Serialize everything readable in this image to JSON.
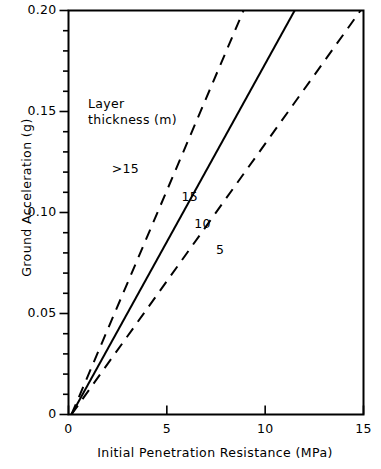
{
  "chart_data": {
    "type": "line",
    "title": "",
    "xlabel": "Initial Penetration Resistance  (MPa)",
    "ylabel": "Ground Acceleration (g)",
    "xlim": [
      0,
      15
    ],
    "ylim": [
      0,
      0.2
    ],
    "grid": false,
    "legend_position": "inline-annotations",
    "legend_title": {
      "line1": "Layer",
      "line2": "thickness (m)"
    },
    "xticks": [
      {
        "value": 0,
        "label": "0"
      },
      {
        "value": 5,
        "label": "5"
      },
      {
        "value": 10,
        "label": "10"
      },
      {
        "value": 15,
        "label": "15"
      }
    ],
    "yticks": [
      {
        "value": 0.0,
        "label": "0"
      },
      {
        "value": 0.05,
        "label": "0.05"
      },
      {
        "value": 0.1,
        "label": "0.10"
      },
      {
        "value": 0.15,
        "label": "0.15"
      },
      {
        "value": 0.2,
        "label": "0.20"
      }
    ],
    "yminor_step": 0.01,
    "series": [
      {
        "name": ">15",
        "label": ">15",
        "style": "dashed",
        "color": "#000000",
        "x": [
          0.15,
          8.9
        ],
        "y": [
          0.0,
          0.2
        ],
        "annotation": {
          "text": ">15",
          "x": 2.2,
          "y": 0.1215
        }
      },
      {
        "name": "15",
        "label": "15",
        "style": "solid",
        "color": "#000000",
        "x": [
          0.15,
          11.5
        ],
        "y": [
          0.0,
          0.2
        ],
        "annotation": {
          "text": "15",
          "x": 5.75,
          "y": 0.1075
        }
      },
      {
        "name": "10",
        "label": "10",
        "style": "solid-shared",
        "color": "#000000",
        "x": [],
        "y": [],
        "annotation": {
          "text": "10",
          "x": 6.4,
          "y": 0.0945
        }
      },
      {
        "name": "5",
        "label": "5",
        "style": "dashed",
        "color": "#000000",
        "x": [
          0.15,
          14.85
        ],
        "y": [
          0.0,
          0.2
        ],
        "annotation": {
          "text": "5",
          "x": 7.5,
          "y": 0.0815
        }
      }
    ]
  }
}
